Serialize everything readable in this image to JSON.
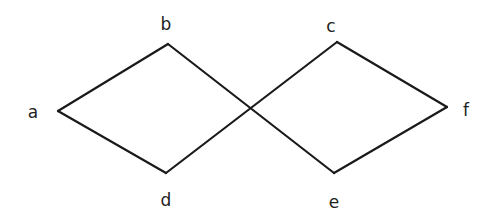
{
  "diagram": {
    "type": "graph",
    "colors": {
      "edge": "#1a1a1a",
      "label": "#222222",
      "background": "#ffffff"
    },
    "nodes": [
      {
        "id": "a",
        "label": "a",
        "x": 58,
        "y": 111,
        "lx": 33,
        "ly": 113
      },
      {
        "id": "b",
        "label": "b",
        "x": 168,
        "y": 44,
        "lx": 166,
        "ly": 25
      },
      {
        "id": "c",
        "label": "c",
        "x": 337,
        "y": 42,
        "lx": 331,
        "ly": 27
      },
      {
        "id": "d",
        "label": "d",
        "x": 166,
        "y": 173,
        "lx": 166,
        "ly": 201
      },
      {
        "id": "e",
        "label": "e",
        "x": 334,
        "y": 173,
        "lx": 334,
        "ly": 203
      },
      {
        "id": "f",
        "label": "f",
        "x": 447,
        "y": 107,
        "lx": 466,
        "ly": 111
      }
    ],
    "edges": [
      [
        "a",
        "b"
      ],
      [
        "a",
        "d"
      ],
      [
        "b",
        "e"
      ],
      [
        "d",
        "c"
      ],
      [
        "c",
        "f"
      ],
      [
        "e",
        "f"
      ]
    ]
  }
}
